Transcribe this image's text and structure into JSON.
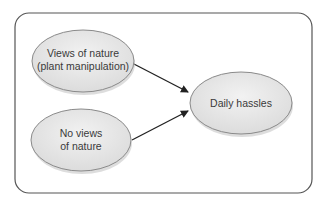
{
  "diagram": {
    "nodes": [
      {
        "id": "views",
        "lines": [
          "Views of nature",
          "(plant manipulation)"
        ]
      },
      {
        "id": "noviews",
        "lines": [
          "No views",
          "of nature"
        ]
      },
      {
        "id": "hassles",
        "lines": [
          "Daily hassles"
        ]
      }
    ],
    "edges": [
      {
        "from": "views",
        "to": "hassles"
      },
      {
        "from": "noviews",
        "to": "hassles"
      }
    ],
    "colors": {
      "node_fill": "#e6e6e6",
      "node_stroke": "#8a8a8a",
      "frame_stroke": "#555555",
      "arrow": "#222222"
    }
  }
}
